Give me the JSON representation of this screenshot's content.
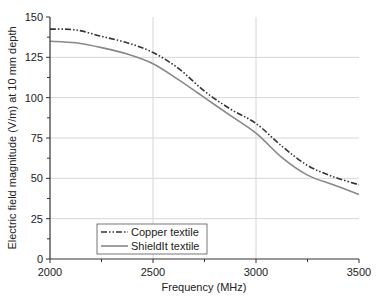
{
  "chart_data": {
    "type": "line",
    "title": "",
    "xlabel": "Frequency (MHz)",
    "ylabel": "Electric field magnitude (V/m) at 10 mm depth",
    "xlim": [
      2000,
      3500
    ],
    "ylim": [
      0,
      150
    ],
    "xticks": [
      2000,
      2500,
      3000,
      3500
    ],
    "yticks": [
      0,
      25,
      50,
      75,
      100,
      125,
      150
    ],
    "grid": true,
    "legend_position": "lower-left",
    "x": [
      2000,
      2125,
      2250,
      2375,
      2500,
      2625,
      2750,
      2875,
      3000,
      3125,
      3250,
      3375,
      3500
    ],
    "series": [
      {
        "name": "Copper textile",
        "style": "dash-dot-dot",
        "color": "#333333",
        "values": [
          142.5,
          142,
          138,
          134,
          128,
          118,
          104,
          93,
          84,
          70,
          58,
          51,
          46
        ]
      },
      {
        "name": "ShieldIt textile",
        "style": "solid",
        "color": "#888888",
        "values": [
          135,
          134,
          131,
          127,
          121,
          111,
          100,
          89,
          78,
          63,
          52,
          46,
          40
        ]
      }
    ]
  },
  "labels": {
    "x_ticks": [
      "2000",
      "2500",
      "3000",
      "3500"
    ],
    "y_ticks": [
      "0",
      "25",
      "50",
      "75",
      "100",
      "125",
      "150"
    ],
    "xlabel": "Frequency (MHz)",
    "ylabel": "Electric field magnitude (V/m) at 10 mm depth",
    "legend": [
      "Copper textile",
      "ShieldIt textile"
    ]
  }
}
